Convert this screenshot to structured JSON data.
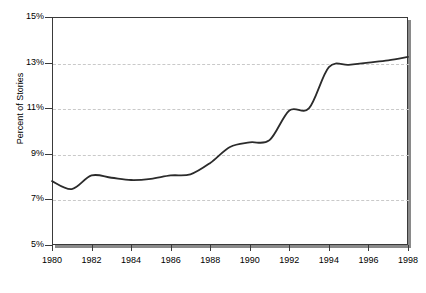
{
  "chart_data": {
    "type": "line",
    "title": "",
    "xlabel": "",
    "ylabel": "Percent of Stories",
    "xlim": [
      1980,
      1998
    ],
    "ylim": [
      5,
      15
    ],
    "ytick_labels": [
      "15%",
      "13%",
      "11%",
      "9%",
      "7%",
      "5%"
    ],
    "ytick_values": [
      15,
      13,
      11,
      9,
      7,
      5
    ],
    "xtick_labels": [
      "1980",
      "1982",
      "1984",
      "1986",
      "1988",
      "1990",
      "1992",
      "1994",
      "1996",
      "1998"
    ],
    "xtick_values": [
      1980,
      1982,
      1984,
      1986,
      1988,
      1990,
      1992,
      1994,
      1996,
      1998
    ],
    "grid": "horizontal-dashed",
    "legend": "none",
    "x": [
      1980,
      1981,
      1982,
      1983,
      1984,
      1985,
      1986,
      1987,
      1988,
      1989,
      1990,
      1991,
      1992,
      1993,
      1994,
      1995,
      1996,
      1997,
      1998
    ],
    "series": [
      {
        "name": "Percent of Stories",
        "color": "#2b2b2b",
        "values": [
          7.8,
          7.45,
          8.05,
          7.95,
          7.85,
          7.9,
          8.05,
          8.1,
          8.6,
          9.3,
          9.5,
          9.6,
          10.9,
          11.0,
          12.8,
          12.9,
          13.0,
          13.1,
          13.25
        ]
      }
    ]
  },
  "axes": {
    "y_title": "Percent of Stories"
  },
  "caption": {
    "text": ""
  },
  "colors": {
    "line": "#2b2b2b",
    "frame": "#3a3a3a",
    "grid": "#c9c9c9",
    "shadow": "#8a8a8a",
    "background": "#ffffff"
  }
}
